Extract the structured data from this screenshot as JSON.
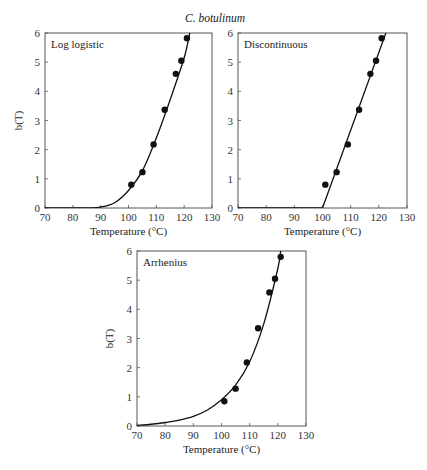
{
  "figure_title": "C. botulinum",
  "chart_data": [
    {
      "type": "scatter",
      "title": "Log logistic",
      "xlabel": "Temperature (°C)",
      "ylabel": "b(T)",
      "xlim": [
        70,
        130
      ],
      "ylim": [
        0,
        6
      ],
      "xticks": [
        70,
        80,
        90,
        100,
        110,
        120,
        130
      ],
      "yticks": [
        0,
        1,
        2,
        3,
        4,
        5,
        6
      ],
      "grid": false,
      "series": [
        {
          "name": "observed",
          "kind": "points",
          "x": [
            101,
            105,
            109,
            113,
            117,
            119,
            121
          ],
          "y": [
            0.8,
            1.23,
            2.18,
            3.37,
            4.6,
            5.05,
            5.82
          ]
        },
        {
          "name": "fit",
          "kind": "line",
          "x": [
            70,
            85,
            90,
            95,
            100,
            105,
            110,
            115,
            120,
            122
          ],
          "y": [
            0,
            0.003,
            0.03,
            0.18,
            0.6,
            1.28,
            2.4,
            3.72,
            5.15,
            6.0
          ]
        }
      ]
    },
    {
      "type": "scatter",
      "title": "Discontinuous",
      "xlabel": "Temperature (°C)",
      "ylabel": "",
      "xlim": [
        70,
        130
      ],
      "ylim": [
        0,
        6
      ],
      "xticks": [
        70,
        80,
        90,
        100,
        110,
        120,
        130
      ],
      "yticks": [
        0,
        1,
        2,
        3,
        4,
        5,
        6
      ],
      "grid": false,
      "series": [
        {
          "name": "observed",
          "kind": "points",
          "x": [
            101,
            105,
            109,
            113,
            117,
            119,
            121
          ],
          "y": [
            0.8,
            1.23,
            2.18,
            3.37,
            4.6,
            5.05,
            5.82
          ]
        },
        {
          "name": "fit",
          "kind": "line",
          "x": [
            70,
            100,
            122.5
          ],
          "y": [
            0,
            0,
            6.0
          ]
        }
      ]
    },
    {
      "type": "scatter",
      "title": "Arrhenius",
      "xlabel": "Temperature (°C)",
      "ylabel": "b(T)",
      "xlim": [
        70,
        130
      ],
      "ylim": [
        0,
        6
      ],
      "xticks": [
        70,
        80,
        90,
        100,
        110,
        120,
        130
      ],
      "yticks": [
        0,
        1,
        2,
        3,
        4,
        5,
        6
      ],
      "grid": false,
      "series": [
        {
          "name": "observed",
          "kind": "points",
          "x": [
            101,
            105,
            109,
            113,
            117,
            119,
            121
          ],
          "y": [
            0.85,
            1.28,
            2.18,
            3.35,
            4.58,
            5.05,
            5.8
          ]
        },
        {
          "name": "fit",
          "kind": "line",
          "x": [
            70,
            75,
            80,
            85,
            90,
            95,
            100,
            105,
            110,
            115,
            120,
            121
          ],
          "y": [
            0.02,
            0.06,
            0.12,
            0.2,
            0.33,
            0.55,
            0.9,
            1.4,
            2.2,
            3.5,
            5.4,
            6.0
          ]
        }
      ]
    }
  ]
}
